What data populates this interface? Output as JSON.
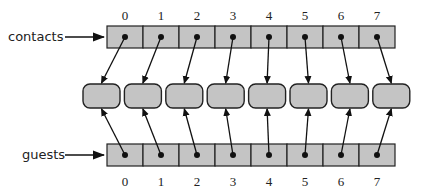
{
  "diagram": {
    "arrays": [
      {
        "name": "contacts",
        "label": "contacts",
        "indices": [
          "0",
          "1",
          "2",
          "3",
          "4",
          "5",
          "6",
          "7"
        ],
        "position": "top"
      },
      {
        "name": "guests",
        "label": "guests",
        "indices": [
          "0",
          "1",
          "2",
          "3",
          "4",
          "5",
          "6",
          "7"
        ],
        "position": "bottom"
      }
    ],
    "object_count": 8,
    "colors": {
      "cell_fill": "#c4c4c4",
      "object_fill": "#c4c4c4",
      "stroke": "#222222",
      "background": "#ffffff"
    }
  }
}
